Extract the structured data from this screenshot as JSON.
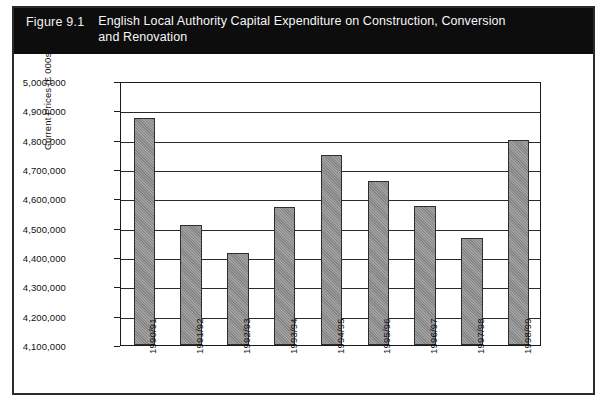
{
  "figure": {
    "number": "Figure 9.1",
    "title": "English Local Authority Capital Expenditure on Construction, Conversion and Renovation",
    "title_bar_color": "#0d0d0d",
    "title_text_color": "#f7f7f7",
    "border_color": "#2b2b2b"
  },
  "chart_data": {
    "type": "bar",
    "title": "English Local Authority Capital Expenditure on Construction, Conversion and Renovation",
    "subtitle": "",
    "xlabel": "",
    "ylabel": "Current Prices (£ 000s)",
    "categories": [
      "1990/91",
      "1991/92",
      "1992/93",
      "1993/94",
      "1994/95",
      "1995/96",
      "1996/97",
      "1997/98",
      "1998/99"
    ],
    "values": [
      4875000,
      4510000,
      4415000,
      4570000,
      4748000,
      4660000,
      4575000,
      4465000,
      4800000
    ],
    "ylim": [
      4100000,
      5000000
    ],
    "ytick_labels": [
      "5,000,000",
      "4,900,000",
      "4,800,000",
      "4,700,000",
      "4,600,000",
      "4,500,000",
      "4,400,000",
      "4,300,000",
      "4,200,000",
      "4,100,000"
    ],
    "ytick_values": [
      5000000,
      4900000,
      4800000,
      4700000,
      4600000,
      4500000,
      4400000,
      4300000,
      4200000,
      4100000
    ],
    "grid": true,
    "grid_axis": "y",
    "legend": false,
    "legend_position": "none",
    "bar_color": "#8d8d8d",
    "bar_edge_color": "#2e2e2e",
    "axis_color": "#1a1a1a",
    "plot_background": "#ffffff"
  }
}
